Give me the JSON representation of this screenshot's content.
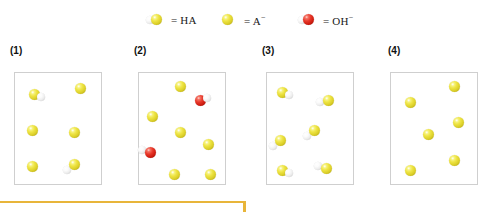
{
  "legend": {
    "items": [
      {
        "name": "HA",
        "label": "= HA",
        "kind": "ha",
        "x": 145
      },
      {
        "name": "A-",
        "label": "= A",
        "sup": "−",
        "kind": "a",
        "x": 218
      },
      {
        "name": "OH-",
        "label": "= OH",
        "sup": "−",
        "kind": "oh",
        "x": 297
      }
    ]
  },
  "colors": {
    "yellow": "#e8dc3c",
    "white": "#f0f0f0",
    "red": "#e02a1c",
    "panel_border": "#cfcfcf",
    "accent": "#e8b53a",
    "label_text": "#111111"
  },
  "panels": [
    {
      "label": "(1)",
      "label_x": 10,
      "x": 14,
      "composition": "2 HA molecules and 4 A− ions",
      "particles": [
        {
          "type": "HA",
          "x": 14,
          "y": 16,
          "h": "right"
        },
        {
          "type": "A",
          "x": 60,
          "y": 10
        },
        {
          "type": "A",
          "x": 12,
          "y": 52
        },
        {
          "type": "A",
          "x": 54,
          "y": 54
        },
        {
          "type": "A",
          "x": 12,
          "y": 88
        },
        {
          "type": "HA",
          "x": 54,
          "y": 86,
          "h": "lowerleft"
        }
      ]
    },
    {
      "label": "(2)",
      "label_x": 134,
      "x": 138,
      "composition": "2 OH− ions and 6 A− ions",
      "particles": [
        {
          "type": "A",
          "x": 36,
          "y": 8
        },
        {
          "type": "OH",
          "x": 56,
          "y": 22,
          "h": "upperright"
        },
        {
          "type": "A",
          "x": 8,
          "y": 38
        },
        {
          "type": "A",
          "x": 36,
          "y": 54
        },
        {
          "type": "A",
          "x": 64,
          "y": 66
        },
        {
          "type": "OH",
          "x": 6,
          "y": 74,
          "h": "upperleft"
        },
        {
          "type": "A",
          "x": 30,
          "y": 96
        },
        {
          "type": "A",
          "x": 66,
          "y": 96
        }
      ]
    },
    {
      "label": "(3)",
      "label_x": 262,
      "x": 266,
      "composition": "6 HA molecules",
      "particles": [
        {
          "type": "HA",
          "x": 10,
          "y": 14,
          "h": "right"
        },
        {
          "type": "HA",
          "x": 56,
          "y": 22,
          "h": "left"
        },
        {
          "type": "HA",
          "x": 42,
          "y": 52,
          "h": "lowerleft"
        },
        {
          "type": "HA",
          "x": 8,
          "y": 62,
          "h": "lowerleft"
        },
        {
          "type": "HA",
          "x": 10,
          "y": 92,
          "h": "right"
        },
        {
          "type": "HA",
          "x": 54,
          "y": 90,
          "h": "upperleft"
        }
      ]
    },
    {
      "label": "(4)",
      "label_x": 388,
      "x": 390,
      "composition": "6 A− ions",
      "particles": [
        {
          "type": "A",
          "x": 58,
          "y": 8
        },
        {
          "type": "A",
          "x": 14,
          "y": 24
        },
        {
          "type": "A",
          "x": 62,
          "y": 44
        },
        {
          "type": "A",
          "x": 32,
          "y": 56
        },
        {
          "type": "A",
          "x": 58,
          "y": 82
        },
        {
          "type": "A",
          "x": 14,
          "y": 92
        }
      ]
    }
  ],
  "accent_bar": {
    "x": 0,
    "y": 201,
    "width": 246,
    "height": 11
  }
}
